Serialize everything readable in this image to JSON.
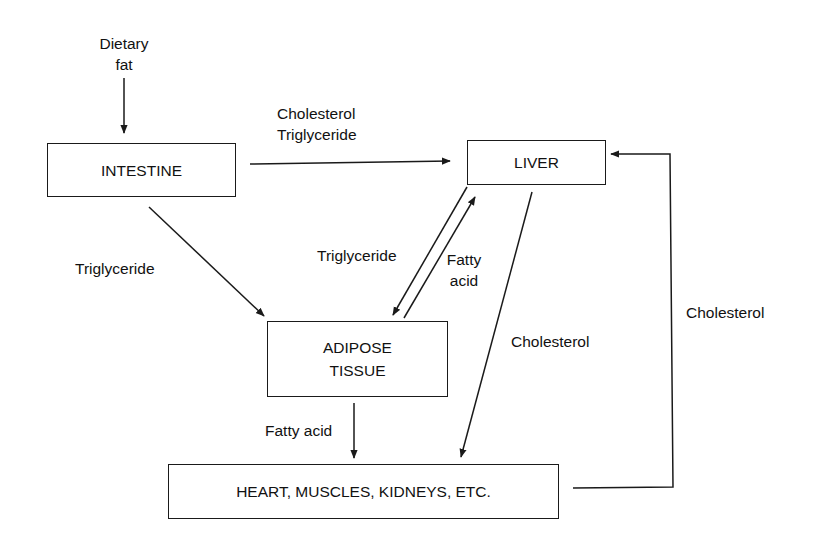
{
  "diagram": {
    "nodes": {
      "intestine": "INTESTINE",
      "liver": "LIVER",
      "adipose_line1": "ADIPOSE",
      "adipose_line2": "TISSUE",
      "organs": "HEART,  MUSCLES,  KIDNEYS,  ETC."
    },
    "labels": {
      "dietary_fat_line1": "Dietary",
      "dietary_fat_line2": "fat",
      "intestine_to_liver_line1": "Cholesterol",
      "intestine_to_liver_line2": "Triglyceride",
      "intestine_to_adipose": "Triglyceride",
      "liver_to_adipose": "Triglyceride",
      "adipose_to_liver_line1": "Fatty",
      "adipose_to_liver_line2": "acid",
      "liver_to_organs": "Cholesterol",
      "organs_to_liver": "Cholesterol",
      "adipose_to_organs": "Fatty acid"
    },
    "edges": [
      {
        "from": "Dietary fat",
        "to": "INTESTINE",
        "label": ""
      },
      {
        "from": "INTESTINE",
        "to": "LIVER",
        "label": "Cholesterol Triglyceride"
      },
      {
        "from": "INTESTINE",
        "to": "ADIPOSE TISSUE",
        "label": "Triglyceride"
      },
      {
        "from": "LIVER",
        "to": "ADIPOSE TISSUE",
        "label": "Triglyceride"
      },
      {
        "from": "ADIPOSE TISSUE",
        "to": "LIVER",
        "label": "Fatty acid"
      },
      {
        "from": "LIVER",
        "to": "HEART, MUSCLES, KIDNEYS, ETC.",
        "label": "Cholesterol"
      },
      {
        "from": "ADIPOSE TISSUE",
        "to": "HEART, MUSCLES, KIDNEYS, ETC.",
        "label": "Fatty acid"
      },
      {
        "from": "HEART, MUSCLES, KIDNEYS, ETC.",
        "to": "LIVER",
        "label": "Cholesterol"
      }
    ],
    "colors": {
      "line": "#1a1a1a",
      "background": "#ffffff"
    }
  }
}
